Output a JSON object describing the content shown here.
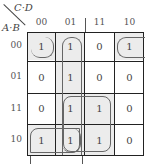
{
  "kmap": {
    "col_var_label": "C·D",
    "row_var_label": "A·B",
    "columns": [
      "00",
      "01",
      "11",
      "10"
    ],
    "rows": [
      "00",
      "01",
      "11",
      "10"
    ],
    "cells": [
      [
        "1",
        "1",
        "0",
        "1"
      ],
      [
        "0",
        "1",
        "0",
        "0"
      ],
      [
        "0",
        "1",
        "1",
        "0"
      ],
      [
        "1",
        "1",
        "1",
        "0"
      ]
    ],
    "groups": [
      {
        "name": "corner-group",
        "cells": "m0,m2,m8",
        "description": "row 00 col 00 and col 10 wrap, row 10 col 00"
      },
      {
        "name": "column-01-group",
        "cells": "col 01 all rows"
      },
      {
        "name": "quad-group",
        "cells": "rows 11,10 cols 01,11"
      },
      {
        "name": "pair-group",
        "cells": "row 10 cols 00,01"
      }
    ]
  }
}
